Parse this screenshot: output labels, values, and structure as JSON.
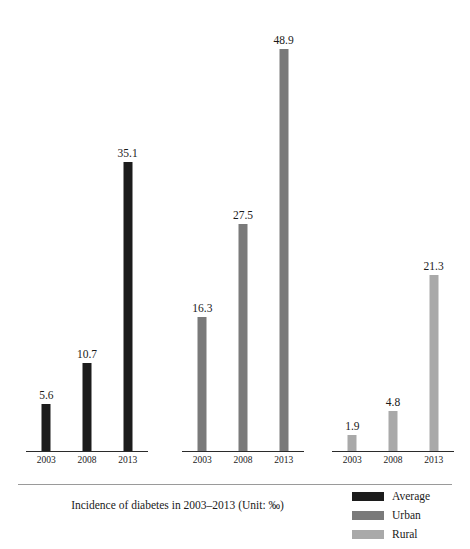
{
  "chart_data": {
    "type": "bar",
    "title": "Incidence of diabetes in 2003–2013 (Unit: ‰)",
    "xlabel": "",
    "ylabel": "",
    "ylim": [
      0,
      48.9
    ],
    "grid": false,
    "legend_position": "bottom-right",
    "categories": [
      "2003",
      "2008",
      "2013"
    ],
    "series": [
      {
        "name": "Average",
        "color": "#1c1c1c",
        "values": [
          5.6,
          10.7,
          35.1
        ],
        "labels": [
          "5.6",
          "10.7",
          "35.1"
        ]
      },
      {
        "name": "Urban",
        "color": "#7a7a7a",
        "values": [
          16.3,
          27.5,
          48.9
        ],
        "labels": [
          "16.3",
          "27.5",
          "48.9"
        ]
      },
      {
        "name": "Rural",
        "color": "#a9a9a9",
        "values": [
          1.9,
          4.8,
          21.3
        ],
        "labels": [
          "1.9",
          "4.8",
          "21.3"
        ]
      }
    ]
  },
  "caption": {
    "text": "Incidence of diabetes in 2003–2013 (Unit: ‰)"
  },
  "legend": {
    "items": [
      {
        "label": "Average",
        "color": "#1c1c1c"
      },
      {
        "label": "Urban",
        "color": "#7a7a7a"
      },
      {
        "label": "Rural",
        "color": "#a9a9a9"
      }
    ]
  },
  "layout": {
    "groups": [
      {
        "name": "Average",
        "left": 26,
        "width": 122
      },
      {
        "name": "Urban",
        "left": 182,
        "width": 122
      },
      {
        "name": "Rural",
        "left": 332,
        "width": 122
      }
    ],
    "pixels_per_unit": 8.22,
    "baseline_y": 452
  }
}
